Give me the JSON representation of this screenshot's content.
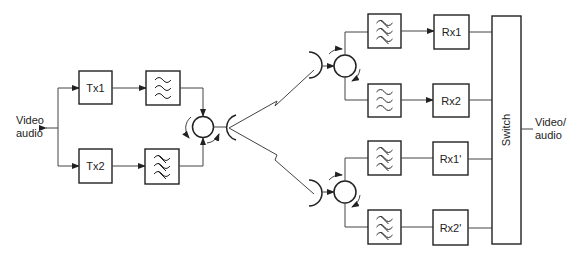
{
  "diagram": {
    "type": "block-diagram",
    "title": "",
    "input_label_line1": "Video",
    "input_label_line2": "audio",
    "output_label_line1": "Video/",
    "output_label_line2": "audio",
    "transmitters": [
      {
        "label": "Tx1"
      },
      {
        "label": "Tx2"
      }
    ],
    "receivers": [
      {
        "label": "Rx1"
      },
      {
        "label": "Rx2"
      },
      {
        "label": "Rx1'"
      },
      {
        "label": "Rx2'"
      }
    ],
    "switch_label": "Switch",
    "filter_icon": "bandpass-filter-icon",
    "circulator_icon": "circulator-icon",
    "antenna_icon": "dish-antenna-icon",
    "radio_link_icon": "zigzag-radio-path-icon",
    "colors": {
      "line": "#222222",
      "background": "#ffffff"
    }
  }
}
